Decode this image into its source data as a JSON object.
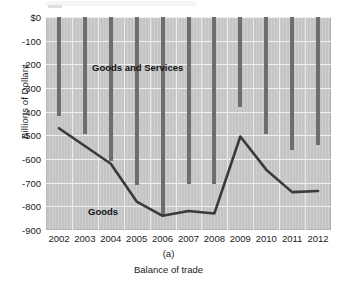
{
  "figure": {
    "panel_label": "(a)",
    "caption": "Balance of trade",
    "ylabel": "Billions of Dollars"
  },
  "annotations": {
    "goods_and_services": "Goods and Services",
    "goods": "Goods"
  },
  "colors": {
    "plot_background": "#c9c9c9",
    "bar": "#6e6e6e",
    "line": "#3a3a3a",
    "gridline": "#f0f0f0",
    "text": "#1a1a1a"
  },
  "chart_data": {
    "type": "bar",
    "title": "Balance of trade",
    "xlabel": "",
    "ylabel": "Billions of Dollars",
    "ylim": [
      -900,
      0
    ],
    "yticks": [
      0,
      -100,
      -200,
      -300,
      -400,
      -500,
      -600,
      -700,
      -800,
      -900
    ],
    "ytick_labels": [
      "$0",
      "-100",
      "-200",
      "-300",
      "-400",
      "-500",
      "-600",
      "-700",
      "-800",
      "-900"
    ],
    "grid": true,
    "legend": "inline-annotations",
    "categories": [
      "2002",
      "2003",
      "2004",
      "2005",
      "2006",
      "2007",
      "2008",
      "2009",
      "2010",
      "2011",
      "2012"
    ],
    "series": [
      {
        "name": "Goods and Services",
        "type": "bar",
        "values": [
          -420,
          -495,
          -610,
          -710,
          -840,
          -705,
          -705,
          -380,
          -495,
          -560,
          -540
        ]
      },
      {
        "name": "Goods",
        "type": "line",
        "values": [
          -470,
          -545,
          -620,
          -780,
          -840,
          -820,
          -830,
          -505,
          -645,
          -740,
          -735
        ]
      }
    ]
  }
}
